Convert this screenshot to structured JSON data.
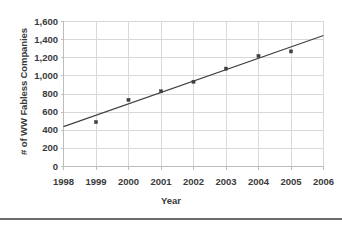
{
  "chart_data": {
    "type": "scatter",
    "title": "",
    "xlabel": "Year",
    "ylabel": "# of WW Fabless Companies",
    "xlim": [
      1998,
      2006
    ],
    "ylim": [
      0,
      1600
    ],
    "grid": true,
    "legend": null,
    "x_tick_labels": [
      "1998",
      "1999",
      "2000",
      "2001",
      "2002",
      "2003",
      "2004",
      "2005",
      "2006"
    ],
    "x_ticks": [
      1998,
      1999,
      2000,
      2001,
      2002,
      2003,
      2004,
      2005,
      2006
    ],
    "y_tick_labels": [
      "0",
      "200",
      "400",
      "600",
      "800",
      "1,000",
      "1,200",
      "1,400",
      "1,600"
    ],
    "y_ticks": [
      0,
      200,
      400,
      600,
      800,
      1000,
      1200,
      1400,
      1600
    ],
    "series": [
      {
        "name": "# of WW Fabless Companies",
        "type": "scatter",
        "marker": "square",
        "color": "#404040",
        "x": [
          1999,
          2000,
          2001,
          2002,
          2003,
          2004,
          2005
        ],
        "values": [
          490,
          735,
          830,
          935,
          1080,
          1220,
          1270
        ]
      },
      {
        "name": "Linear trend",
        "type": "line",
        "color": "#404040",
        "x": [
          1998,
          2006
        ],
        "values": [
          440,
          1445
        ]
      }
    ],
    "points": [
      {
        "year": "1999",
        "value": 490
      },
      {
        "year": "2000",
        "value": 735
      },
      {
        "year": "2001",
        "value": 830
      },
      {
        "year": "2002",
        "value": 935
      },
      {
        "year": "2003",
        "value": 1080
      },
      {
        "year": "2004",
        "value": 1220
      },
      {
        "year": "2005",
        "value": 1270
      }
    ]
  },
  "colors": {
    "text": "#3a3a3a",
    "marker": "#404040",
    "trendline": "#404040",
    "grid": "#d8d8d8",
    "axis": "#bdbdbd",
    "rule": "#6d6d6d",
    "background": "#ffffff"
  }
}
